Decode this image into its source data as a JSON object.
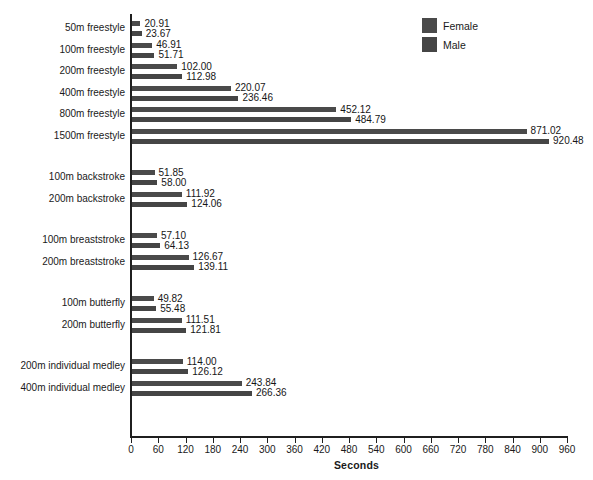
{
  "chart_data": {
    "type": "bar",
    "orientation": "horizontal",
    "title": "",
    "xlabel": "Seconds",
    "ylabel": "",
    "xlim": [
      0,
      960
    ],
    "xticks": [
      0,
      60,
      120,
      180,
      240,
      300,
      360,
      420,
      480,
      540,
      600,
      660,
      720,
      780,
      840,
      900,
      960
    ],
    "grid": false,
    "legend_position": "top-right",
    "value_label_format": "2 decimals",
    "categories": [
      "50m freestyle",
      "100m freestyle",
      "200m freestyle",
      "400m freestyle",
      "800m freestyle",
      "1500m freestyle",
      "100m backstroke",
      "200m backstroke",
      "100m breaststroke",
      "200m breaststroke",
      "100m butterfly",
      "200m butterfly",
      "200m individual medley",
      "400m individual medley"
    ],
    "groups": [
      {
        "name": "freestyle",
        "categories": [
          "50m freestyle",
          "100m freestyle",
          "200m freestyle",
          "400m freestyle",
          "800m freestyle",
          "1500m freestyle"
        ]
      },
      {
        "name": "backstroke",
        "categories": [
          "100m backstroke",
          "200m backstroke"
        ]
      },
      {
        "name": "breaststroke",
        "categories": [
          "100m breaststroke",
          "200m breaststroke"
        ]
      },
      {
        "name": "butterfly",
        "categories": [
          "100m butterfly",
          "200m butterfly"
        ]
      },
      {
        "name": "individual medley",
        "categories": [
          "200m individual medley",
          "400m individual medley"
        ]
      }
    ],
    "series": [
      {
        "name": "Female",
        "color": "#4a4a4a",
        "values": [
          20.91,
          46.91,
          102.0,
          220.07,
          452.12,
          871.02,
          51.85,
          111.92,
          57.1,
          126.67,
          49.82,
          111.51,
          114.0,
          243.84
        ],
        "labels": [
          "20.91",
          "46.91",
          "102.00",
          "220.07",
          "452.12",
          "871.02",
          "51.85",
          "111.92",
          "57.10",
          "126.67",
          "49.82",
          "111.51",
          "114.00",
          "243.84"
        ]
      },
      {
        "name": "Male",
        "color": "#454545",
        "values": [
          23.67,
          51.71,
          112.98,
          236.46,
          484.79,
          920.48,
          58.0,
          124.06,
          64.13,
          139.11,
          55.48,
          121.81,
          126.12,
          266.36
        ],
        "labels": [
          "23.67",
          "51.71",
          "112.98",
          "236.46",
          "484.79",
          "920.48",
          "58.00",
          "124.06",
          "64.13",
          "139.11",
          "55.48",
          "121.81",
          "126.12",
          "266.36"
        ]
      }
    ]
  },
  "legend": {
    "items": [
      {
        "label": "Female",
        "color": "#4a4a4a"
      },
      {
        "label": "Male",
        "color": "#454545"
      }
    ]
  },
  "axis": {
    "x_title": "Seconds"
  }
}
